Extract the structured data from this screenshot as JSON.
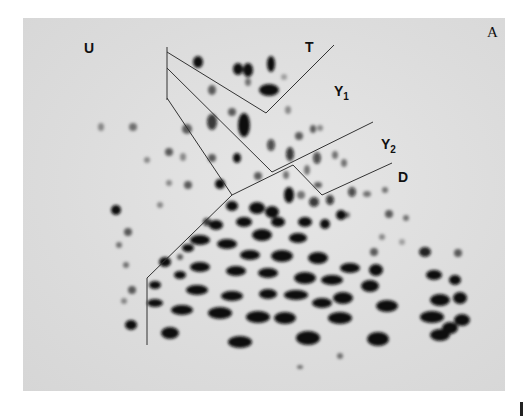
{
  "figure": {
    "panel_label": "A",
    "type": "2D gel electrophoresis autoradiograph",
    "background_color": "#dcdcdc",
    "spot_color": "#0a0a0a",
    "line_color": "#333333"
  },
  "region_labels": [
    {
      "id": "U",
      "text": "U",
      "sub": "",
      "x": 84,
      "y": 41
    },
    {
      "id": "T",
      "text": "T",
      "sub": "",
      "x": 305,
      "y": 40
    },
    {
      "id": "Y1",
      "text": "Y",
      "sub": "1",
      "x": 334,
      "y": 84
    },
    {
      "id": "Y2",
      "text": "Y",
      "sub": "2",
      "x": 381,
      "y": 137
    },
    {
      "id": "D",
      "text": "D",
      "sub": "",
      "x": 398,
      "y": 170
    }
  ],
  "boundary_lines": [
    {
      "name": "vertical-top-tick",
      "points": [
        [
          167,
          47
        ],
        [
          167,
          100
        ]
      ]
    },
    {
      "name": "T-bracket",
      "points": [
        [
          167,
          52
        ],
        [
          266,
          113
        ],
        [
          334,
          45
        ]
      ]
    },
    {
      "name": "Y1-Y2-boundary",
      "points": [
        [
          167,
          68
        ],
        [
          272,
          172
        ],
        [
          373,
          122
        ]
      ]
    },
    {
      "name": "Y2-D-boundary",
      "points": [
        [
          293,
          165
        ],
        [
          322,
          195
        ],
        [
          392,
          163
        ]
      ]
    },
    {
      "name": "left-boundary",
      "points": [
        [
          167,
          98
        ],
        [
          232,
          195
        ],
        [
          293,
          165
        ]
      ]
    },
    {
      "name": "left-lower-boundary",
      "points": [
        [
          232,
          195
        ],
        [
          147,
          278
        ],
        [
          147,
          345
        ]
      ]
    }
  ],
  "spots": [
    [
      198,
      62,
      5,
      6,
      1
    ],
    [
      238,
      69,
      5,
      6,
      1
    ],
    [
      248,
      70,
      5,
      7,
      1
    ],
    [
      271,
      64,
      4,
      8,
      1
    ],
    [
      269,
      90,
      10,
      6,
      1
    ],
    [
      284,
      77,
      3,
      3,
      0.3
    ],
    [
      248,
      82,
      3,
      4,
      0.5
    ],
    [
      212,
      90,
      4,
      5,
      0.6
    ],
    [
      232,
      112,
      4,
      4,
      0.6
    ],
    [
      212,
      122,
      5,
      8,
      0.8
    ],
    [
      244,
      125,
      6,
      12,
      1
    ],
    [
      133,
      127,
      4,
      4,
      0.5
    ],
    [
      101,
      127,
      3,
      4,
      0.4
    ],
    [
      187,
      129,
      5,
      5,
      0.6
    ],
    [
      288,
      110,
      3,
      4,
      0.4
    ],
    [
      299,
      136,
      4,
      4,
      0.6
    ],
    [
      313,
      129,
      3,
      4,
      0.6
    ],
    [
      320,
      128,
      3,
      3,
      0.4
    ],
    [
      271,
      145,
      4,
      6,
      0.7
    ],
    [
      290,
      154,
      4,
      7,
      0.8
    ],
    [
      317,
      158,
      4,
      6,
      0.7
    ],
    [
      335,
      155,
      3,
      4,
      0.5
    ],
    [
      344,
      163,
      3,
      4,
      0.5
    ],
    [
      307,
      170,
      3,
      5,
      0.5
    ],
    [
      237,
      158,
      4,
      5,
      1
    ],
    [
      212,
      158,
      4,
      4,
      0.6
    ],
    [
      183,
      157,
      3,
      4,
      0.4
    ],
    [
      169,
      152,
      4,
      4,
      0.6
    ],
    [
      147,
      160,
      3,
      3,
      0.4
    ],
    [
      220,
      184,
      5,
      5,
      1
    ],
    [
      169,
      183,
      3,
      3,
      0.4
    ],
    [
      188,
      185,
      4,
      4,
      0.6
    ],
    [
      160,
      205,
      3,
      3,
      0.4
    ],
    [
      258,
      176,
      4,
      4,
      0.6
    ],
    [
      286,
      175,
      3,
      4,
      0.5
    ],
    [
      318,
      185,
      4,
      3,
      0.6
    ],
    [
      301,
      195,
      4,
      4,
      0.5
    ],
    [
      314,
      202,
      5,
      5,
      0.8
    ],
    [
      330,
      200,
      4,
      5,
      0.8
    ],
    [
      352,
      192,
      4,
      5,
      0.7
    ],
    [
      367,
      194,
      4,
      3,
      0.5
    ],
    [
      385,
      190,
      3,
      3,
      0.5
    ],
    [
      347,
      215,
      3,
      3,
      0.5
    ],
    [
      389,
      214,
      4,
      4,
      0.6
    ],
    [
      406,
      218,
      3,
      3,
      0.5
    ],
    [
      116,
      210,
      5,
      5,
      1
    ],
    [
      128,
      232,
      4,
      4,
      0.6
    ],
    [
      119,
      245,
      3,
      3,
      0.5
    ],
    [
      126,
      265,
      3,
      3,
      0.5
    ],
    [
      132,
      290,
      4,
      4,
      0.6
    ],
    [
      124,
      301,
      3,
      3,
      0.4
    ],
    [
      131,
      325,
      6,
      5,
      1
    ],
    [
      170,
      333,
      9,
      6,
      1
    ],
    [
      240,
      342,
      12,
      6,
      1
    ],
    [
      308,
      338,
      12,
      7,
      1
    ],
    [
      378,
      339,
      11,
      7,
      1
    ],
    [
      440,
      335,
      10,
      6,
      1
    ],
    [
      450,
      328,
      8,
      6,
      1
    ],
    [
      462,
      320,
      8,
      6,
      1
    ],
    [
      460,
      298,
      7,
      6,
      1
    ],
    [
      455,
      280,
      6,
      5,
      1
    ],
    [
      434,
      275,
      8,
      5,
      1
    ],
    [
      425,
      252,
      6,
      5,
      0.9
    ],
    [
      440,
      300,
      10,
      6,
      1
    ],
    [
      432,
      317,
      12,
      6,
      1
    ],
    [
      376,
      270,
      7,
      6,
      1
    ],
    [
      374,
      252,
      4,
      4,
      0.6
    ],
    [
      382,
      237,
      3,
      3,
      0.4
    ],
    [
      402,
      242,
      3,
      3,
      0.3
    ],
    [
      458,
      253,
      4,
      4,
      0.6
    ],
    [
      370,
      286,
      9,
      6,
      1
    ],
    [
      387,
      306,
      11,
      6,
      1
    ],
    [
      340,
      318,
      12,
      6,
      1
    ],
    [
      343,
      298,
      10,
      6,
      1
    ],
    [
      322,
      303,
      10,
      5,
      1
    ],
    [
      285,
      318,
      11,
      6,
      1
    ],
    [
      258,
      317,
      12,
      6,
      1
    ],
    [
      220,
      313,
      12,
      6,
      1
    ],
    [
      182,
      310,
      11,
      5,
      1
    ],
    [
      155,
      303,
      8,
      4,
      1
    ],
    [
      197,
      290,
      11,
      5,
      1
    ],
    [
      232,
      296,
      11,
      5,
      1
    ],
    [
      268,
      294,
      9,
      5,
      1
    ],
    [
      296,
      295,
      12,
      5,
      1
    ],
    [
      332,
      280,
      11,
      5,
      1
    ],
    [
      350,
      268,
      10,
      5,
      1
    ],
    [
      305,
      278,
      11,
      6,
      1
    ],
    [
      268,
      273,
      10,
      5,
      1
    ],
    [
      236,
      271,
      10,
      5,
      1
    ],
    [
      200,
      267,
      10,
      5,
      1
    ],
    [
      165,
      262,
      6,
      5,
      1
    ],
    [
      180,
      275,
      6,
      4,
      1
    ],
    [
      250,
      255,
      10,
      5,
      1
    ],
    [
      282,
      256,
      11,
      6,
      1
    ],
    [
      318,
      258,
      10,
      6,
      1
    ],
    [
      227,
      244,
      10,
      5,
      1
    ],
    [
      200,
      240,
      10,
      5,
      1
    ],
    [
      262,
      235,
      10,
      6,
      1
    ],
    [
      298,
      238,
      9,
      5,
      1
    ],
    [
      188,
      248,
      6,
      4,
      1
    ],
    [
      216,
      225,
      7,
      5,
      1
    ],
    [
      244,
      222,
      8,
      5,
      1
    ],
    [
      272,
      212,
      7,
      6,
      1
    ],
    [
      257,
      208,
      8,
      6,
      1
    ],
    [
      232,
      206,
      6,
      5,
      1
    ],
    [
      289,
      195,
      5,
      8,
      1
    ],
    [
      278,
      222,
      7,
      5,
      1
    ],
    [
      305,
      222,
      7,
      5,
      1
    ],
    [
      325,
      224,
      5,
      5,
      1
    ],
    [
      341,
      215,
      5,
      5,
      1
    ],
    [
      207,
      222,
      4,
      4,
      0.8
    ],
    [
      180,
      257,
      3,
      3,
      0.6
    ],
    [
      155,
      285,
      6,
      4,
      1
    ],
    [
      300,
      367,
      3,
      2,
      0.5
    ],
    [
      340,
      356,
      3,
      3,
      0.5
    ]
  ]
}
